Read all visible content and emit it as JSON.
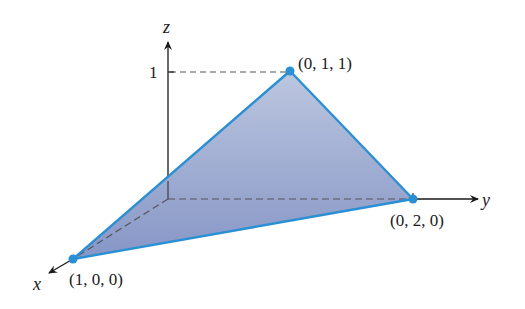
{
  "figure": {
    "type": "3d-plane-triangle",
    "axes": {
      "x_label": "x",
      "y_label": "y",
      "z_label": "z",
      "z_tick_label": "1"
    },
    "points": [
      {
        "id": "A",
        "label": "(1, 0, 0)",
        "coords": [
          1,
          0,
          0
        ]
      },
      {
        "id": "B",
        "label": "(0, 2, 0)",
        "coords": [
          0,
          2,
          0
        ]
      },
      {
        "id": "C",
        "label": "(0, 1, 1)",
        "coords": [
          0,
          1,
          1
        ]
      }
    ],
    "colors": {
      "edge": "#2b8fd3",
      "fill_top": "#b9c4de",
      "fill_bottom": "#8797c6",
      "point": "#2b8fd3",
      "axis": "#1a1a1a",
      "dashed": "#555555"
    }
  }
}
